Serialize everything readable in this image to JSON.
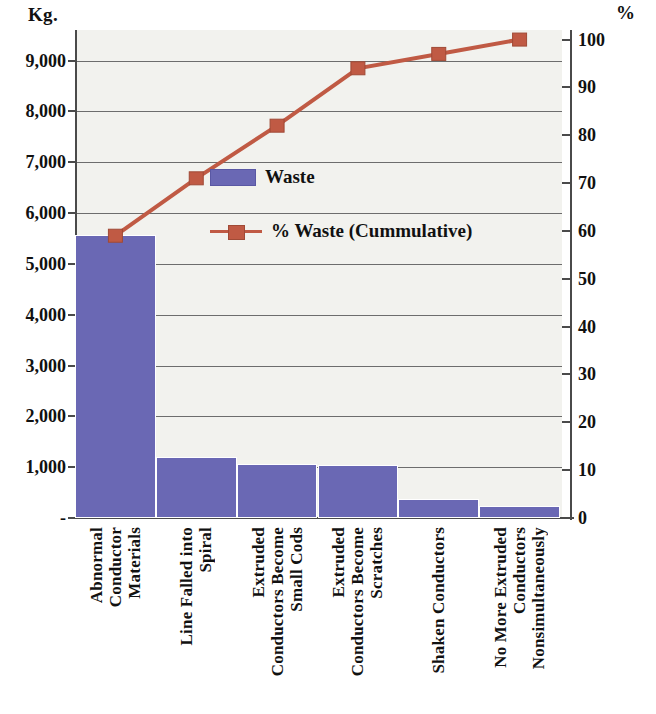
{
  "axes": {
    "left_unit": "Kg.",
    "right_unit": "%",
    "left_ticks": [
      "9,000",
      "8,000",
      "7,000",
      "6,000",
      "5,000",
      "4,000",
      "3,000",
      "2,000",
      "1,000",
      "-"
    ],
    "right_ticks": [
      "100",
      "90",
      "80",
      "70",
      "60",
      "50",
      "40",
      "30",
      "20",
      "10",
      "0"
    ]
  },
  "legend": {
    "bar_label": "Waste",
    "line_label": "% Waste (Cummulative)"
  },
  "colors": {
    "bar": "#6a68b4",
    "line": "#c05a44",
    "plot_background": "#f2f2ee",
    "grid": "#6d6d6d",
    "axis": "#4a4a4a"
  },
  "chart_data": {
    "type": "bar",
    "title": "",
    "xlabel": "",
    "ylabel": "Kg.",
    "y2label": "%",
    "ylim": [
      0,
      9600
    ],
    "y2lim": [
      0,
      102
    ],
    "grid": true,
    "legend_position": "center",
    "categories": [
      "Abnormal Conductor Materials",
      "Line Falled into Spiral",
      "Extruded Conductors Become Small Cods",
      "Extruded Conductors Become Scratches",
      "Shaken Conductors",
      "No More Extruded Conductors Nonsimultaneously"
    ],
    "category_lines": [
      [
        "Abnormal",
        "Conductor",
        "Materials"
      ],
      [
        "Line Falled into",
        "Spiral"
      ],
      [
        "Extruded",
        "Conductors Become",
        "Small Cods"
      ],
      [
        "Extruded",
        "Conductors Become",
        "Scratches"
      ],
      [
        "Shaken Conductors"
      ],
      [
        "No More Extruded",
        "Conductors",
        "Nonsimultaneously"
      ]
    ],
    "series": [
      {
        "name": "Waste",
        "type": "bar",
        "axis": "left",
        "unit": "Kg.",
        "values": [
          5570,
          1200,
          1070,
          1040,
          370,
          230
        ]
      },
      {
        "name": "% Waste (Cummulative)",
        "type": "line",
        "axis": "right",
        "unit": "%",
        "values": [
          59,
          71,
          82,
          94,
          97,
          100
        ]
      }
    ]
  }
}
